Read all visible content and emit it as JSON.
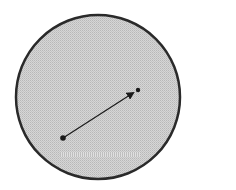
{
  "diagram": {
    "type": "circle-with-vector",
    "circle": {
      "cx": 98,
      "cy": 97,
      "r": 82,
      "fill": "#cfcfcf",
      "stroke": "#2a2a2a"
    },
    "vector": {
      "start": [
        63,
        138
      ],
      "end": [
        136,
        91
      ],
      "color": "#1a1a1a"
    },
    "background": "#ffffff"
  }
}
